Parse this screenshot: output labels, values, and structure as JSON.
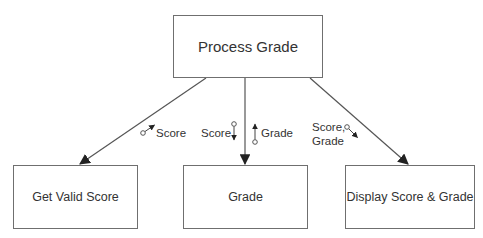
{
  "diagram": {
    "type": "structure-chart",
    "modules": {
      "top": {
        "id": "process-grade",
        "label": "Process Grade"
      },
      "children": [
        {
          "id": "get-valid-score",
          "label": "Get Valid Score"
        },
        {
          "id": "grade",
          "label": "Grade"
        },
        {
          "id": "display-score-grade",
          "label": "Display Score & Grade"
        }
      ]
    },
    "connections": [
      {
        "from": "process-grade",
        "to": "get-valid-score",
        "data_couples": [
          {
            "label": "Score",
            "direction": "up (return to caller)"
          }
        ]
      },
      {
        "from": "process-grade",
        "to": "grade",
        "data_couples": [
          {
            "label": "Score",
            "direction": "down (passed in)"
          },
          {
            "label": "Grade",
            "direction": "up (return to caller)"
          }
        ]
      },
      {
        "from": "process-grade",
        "to": "display-score-grade",
        "data_couples": [
          {
            "label": "Score,",
            "label_line2": "Grade",
            "direction": "down (passed in)"
          }
        ]
      }
    ],
    "colors": {
      "line": "#555555",
      "box_border": "#6f6f6f",
      "text": "#333333",
      "background": "#ffffff"
    }
  }
}
